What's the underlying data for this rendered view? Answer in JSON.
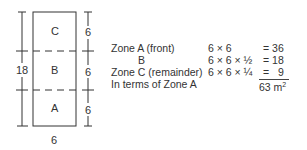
{
  "diagram": {
    "zones": [
      {
        "id": "C",
        "label": "C",
        "depth": "6"
      },
      {
        "id": "B",
        "label": "B",
        "depth": "6"
      },
      {
        "id": "A",
        "label": "A",
        "depth": "6"
      }
    ],
    "total_depth": "18",
    "width": "6"
  },
  "calculation": {
    "rows": [
      {
        "label": "Zone A (front)",
        "expr": "6 × 6",
        "result": "= 36"
      },
      {
        "label": "B",
        "expr": "6 × 6 × ½",
        "result": "= 18"
      },
      {
        "label": "Zone C (remainder)",
        "expr": "6 × 6 × ¼",
        "result": "=   9"
      },
      {
        "label": "In terms of Zone A",
        "expr": "",
        "result": ""
      }
    ],
    "total_value": "63 m",
    "total_unit_sup": "2"
  },
  "colors": {
    "line": "#333333",
    "text": "#333333",
    "background": "#ffffff"
  }
}
